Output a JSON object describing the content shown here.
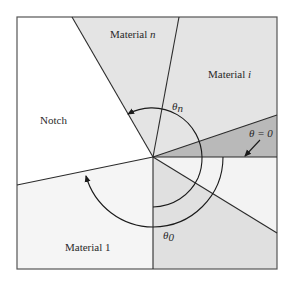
{
  "diagram": {
    "type": "multi-material notch wedge",
    "regions": [
      {
        "id": "notch",
        "label": "Notch",
        "fill": "#ffffff"
      },
      {
        "id": "material-n",
        "label_prefix": "Material ",
        "label_var": "n",
        "fill": "#e4e4e4"
      },
      {
        "id": "material-i",
        "label_prefix": "Material ",
        "label_var": "i",
        "fill": "#e4e4e4"
      },
      {
        "id": "wedge-dark",
        "label": "",
        "fill": "#b9b9b9"
      },
      {
        "id": "wedge-light",
        "label": "",
        "fill": "#f3f3f3"
      },
      {
        "id": "material-lower-right",
        "label": "",
        "fill": "#e0e0e0"
      },
      {
        "id": "material-1",
        "label": "Material 1",
        "fill": "#f5f5f5"
      }
    ],
    "annotations": {
      "theta_zero": "θ = 0",
      "theta_n_symbol": "θ",
      "theta_n_sub": "n",
      "theta_0_symbol": "θ",
      "theta_0_sub": "0"
    },
    "colors": {
      "line": "#2b2b2b",
      "frame": "#555555"
    }
  }
}
